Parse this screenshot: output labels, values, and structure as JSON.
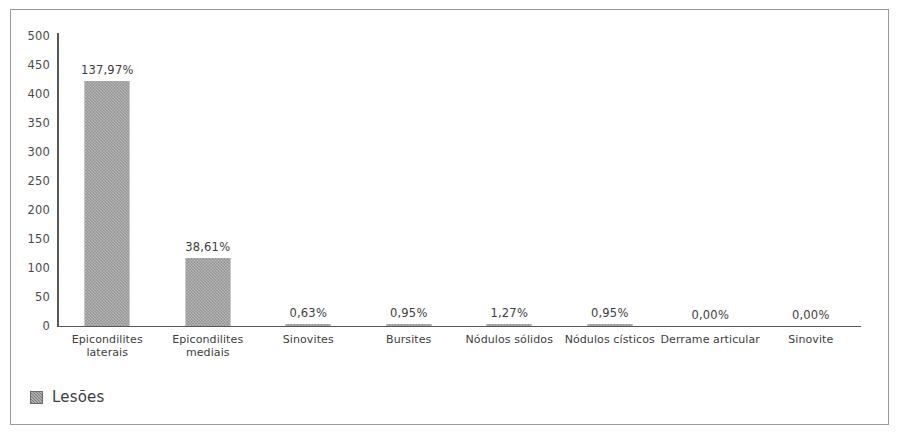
{
  "chart_data": {
    "type": "bar",
    "title": "",
    "xlabel": "",
    "ylabel": "",
    "ylim": [
      0,
      500
    ],
    "ytick_step": 50,
    "grid": false,
    "legend_position": "bottom-left",
    "series_name": "Lesões",
    "bar_color": "#8b8b8b",
    "axis_color": "#55585b",
    "border_color": "#9a9a9a",
    "categories": [
      "Epicondilites\nlaterais",
      "Epicondilites\nmediais",
      "Sinovites",
      "Bursites",
      "Nódulos sólidos",
      "Nódulos císticos",
      "Derrame articular",
      "Sinovite"
    ],
    "values": [
      422,
      117,
      2,
      3,
      4,
      3,
      0,
      0
    ],
    "data_labels": [
      "137,97%",
      "38,61%",
      "0,63%",
      "0,95%",
      "1,27%",
      "0,95%",
      "0,00%",
      "0,00%"
    ],
    "yticks": [
      "500",
      "450",
      "400",
      "350",
      "300",
      "250",
      "200",
      "150",
      "100",
      "50",
      "0"
    ],
    "ytick_values": [
      500,
      450,
      400,
      350,
      300,
      250,
      200,
      150,
      100,
      50,
      0
    ]
  },
  "legend": {
    "label": "Lesões",
    "swatch": "series-color-swatch"
  }
}
